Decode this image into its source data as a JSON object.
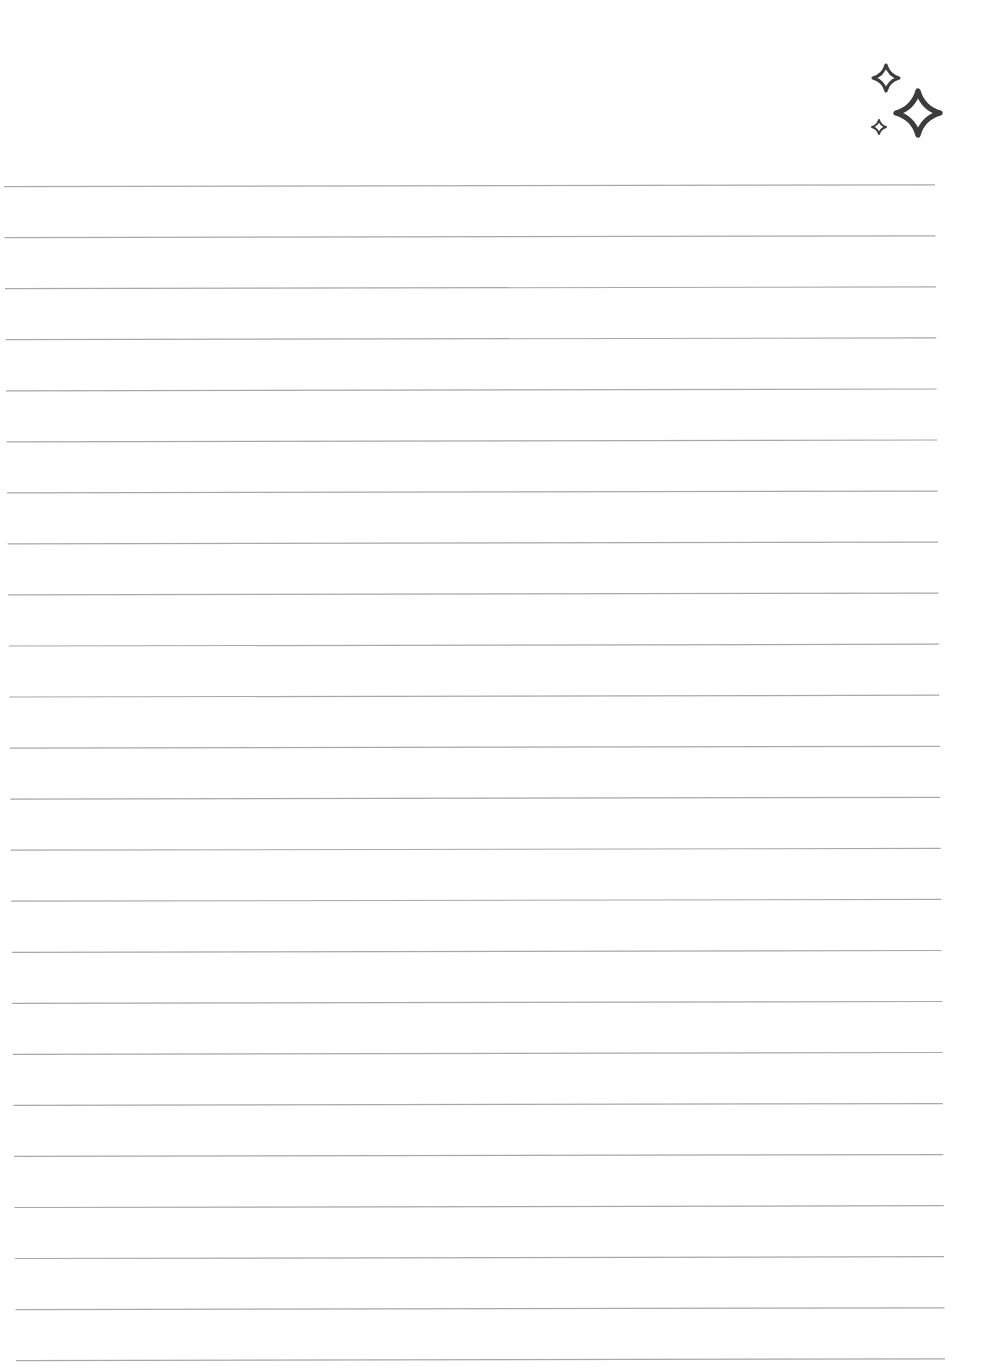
{
  "page": {
    "type": "lined-notebook-page",
    "background": "#ffffff",
    "text_content": ""
  },
  "decoration": {
    "icon": "sparkles-icon",
    "color": "#3c3c3c",
    "sparkles": [
      {
        "name": "sparkle-medium",
        "cx": 886,
        "cy": 78,
        "size": 26
      },
      {
        "name": "sparkle-large",
        "cx": 918,
        "cy": 113,
        "size": 44
      },
      {
        "name": "sparkle-small",
        "cx": 879,
        "cy": 127,
        "size": 14
      }
    ]
  },
  "ruled_lines": {
    "count": 24,
    "color": "#a8a8a8",
    "first_y": 186,
    "last_y": 1360,
    "left_start_x": 4,
    "left_end_x": 16,
    "right_start_x": 935,
    "right_end_x": 945,
    "stroke_width": 1.2
  }
}
